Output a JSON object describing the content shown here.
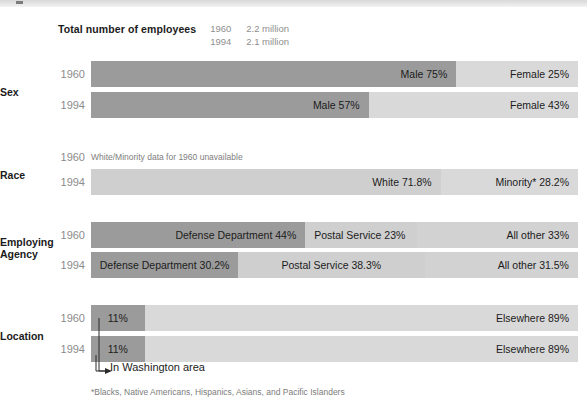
{
  "header": {
    "title": "Total number of employees",
    "rows": [
      {
        "year": "1960",
        "value": "2.2 million"
      },
      {
        "year": "1994",
        "value": "2.1 million"
      }
    ]
  },
  "groups": [
    {
      "label": "Sex",
      "label_line2": "",
      "rows": [
        {
          "year": "1960",
          "segments": [
            {
              "label": "Male  75%",
              "value": 75,
              "tone": "dark",
              "align": "right"
            },
            {
              "label": "Female 25%",
              "value": 25,
              "tone": "light",
              "align": "right"
            }
          ]
        },
        {
          "year": "1994",
          "segments": [
            {
              "label": "Male  57%",
              "value": 57,
              "tone": "dark",
              "align": "right"
            },
            {
              "label": "Female 43%",
              "value": 43,
              "tone": "light",
              "align": "right"
            }
          ]
        }
      ]
    },
    {
      "label": "Race",
      "label_line2": "",
      "rows": [
        {
          "year": "1960",
          "note": "White/Minority data for 1960 unavailable",
          "segments": []
        },
        {
          "year": "1994",
          "segments": [
            {
              "label": "White  71.8%",
              "value": 71.8,
              "tone": "mid",
              "align": "right"
            },
            {
              "label": "Minority*  28.2%",
              "value": 28.2,
              "tone": "light",
              "align": "right"
            }
          ]
        }
      ]
    },
    {
      "label": "Employing",
      "label_line2": "Agency",
      "rows": [
        {
          "year": "1960",
          "segments": [
            {
              "label": "Defense Department  44%",
              "value": 44,
              "tone": "dark",
              "align": "right"
            },
            {
              "label": "Postal Service  23%",
              "value": 23,
              "tone": "mid",
              "align": "left"
            },
            {
              "label": "All other  33%",
              "value": 33,
              "tone": "light2",
              "align": "right"
            }
          ]
        },
        {
          "year": "1994",
          "segments": [
            {
              "label": "Defense Department  30.2%",
              "value": 30.2,
              "tone": "dark",
              "align": "center"
            },
            {
              "label": "Postal Service  38.3%",
              "value": 38.3,
              "tone": "mid",
              "align": "center"
            },
            {
              "label": "All other  31.5%",
              "value": 31.5,
              "tone": "light2",
              "align": "right"
            }
          ]
        }
      ]
    },
    {
      "label": "Location",
      "label_line2": "",
      "rows": [
        {
          "year": "1960",
          "segments": [
            {
              "label": "11%",
              "value": 11,
              "tone": "dark",
              "align": "center"
            },
            {
              "label": "Elsewhere  89%",
              "value": 89,
              "tone": "light",
              "align": "right"
            }
          ]
        },
        {
          "year": "1994",
          "segments": [
            {
              "label": "11%",
              "value": 11,
              "tone": "dark",
              "align": "center"
            },
            {
              "label": "Elsewhere  89%",
              "value": 89,
              "tone": "light",
              "align": "right"
            }
          ]
        }
      ]
    }
  ],
  "callout": {
    "text": "In Washington area"
  },
  "footnote": "*Blacks, Native Americans, Hispanics, Asians, and Pacific Islanders",
  "colors": {
    "dark": "#9b9b9b",
    "mid": "#cfcfcf",
    "light": "#d9d9d9",
    "light2": "#d2d2d2",
    "year_text": "#8c8c8c",
    "label_text": "#1c1c1c"
  },
  "chart_data": {
    "type": "bar",
    "title": "Total number of employees",
    "subtitle": "Federal civilian workforce composition, 1960 vs 1994",
    "xlabel": "Percent of employees",
    "ylabel": "",
    "xlim": [
      0,
      100
    ],
    "grid": false,
    "legend": "none",
    "orientation": "horizontal-stacked",
    "totals": [
      {
        "year": "1960",
        "employees": "2.2 million"
      },
      {
        "year": "1994",
        "employees": "2.1 million"
      }
    ],
    "groups": [
      {
        "category": "Sex",
        "series": [
          {
            "year": "1960",
            "categories": [
              "Male",
              "Female"
            ],
            "values": [
              75,
              25
            ]
          },
          {
            "year": "1994",
            "categories": [
              "Male",
              "Female"
            ],
            "values": [
              57,
              43
            ]
          }
        ]
      },
      {
        "category": "Race",
        "series": [
          {
            "year": "1960",
            "categories": [],
            "values": [],
            "note": "White/Minority data for 1960 unavailable"
          },
          {
            "year": "1994",
            "categories": [
              "White",
              "Minority*"
            ],
            "values": [
              71.8,
              28.2
            ]
          }
        ]
      },
      {
        "category": "Employing Agency",
        "series": [
          {
            "year": "1960",
            "categories": [
              "Defense Department",
              "Postal Service",
              "All other"
            ],
            "values": [
              44,
              23,
              33
            ]
          },
          {
            "year": "1994",
            "categories": [
              "Defense Department",
              "Postal Service",
              "All other"
            ],
            "values": [
              30.2,
              38.3,
              31.5
            ]
          }
        ]
      },
      {
        "category": "Location",
        "series": [
          {
            "year": "1960",
            "categories": [
              "In Washington area",
              "Elsewhere"
            ],
            "values": [
              11,
              89
            ]
          },
          {
            "year": "1994",
            "categories": [
              "In Washington area",
              "Elsewhere"
            ],
            "values": [
              11,
              89
            ]
          }
        ]
      }
    ],
    "annotations": [
      {
        "text": "In Washington area",
        "points_to": "first segment of Location bars"
      },
      {
        "text": "*Blacks, Native Americans, Hispanics, Asians, and Pacific Islanders"
      }
    ]
  }
}
